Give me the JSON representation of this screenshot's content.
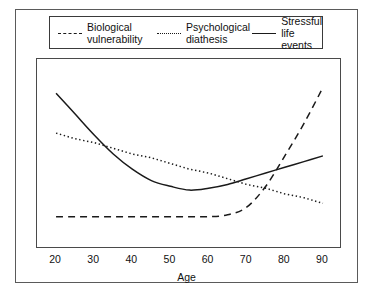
{
  "legend": {
    "position": "top",
    "entries": [
      {
        "name": "biological-vulnerability",
        "label": "Biological\nvulnerability",
        "style": "dashed",
        "color": "#1a1a1a"
      },
      {
        "name": "psychological-diathesis",
        "label": "Psychological\ndiathesis",
        "style": "dotted",
        "color": "#1a1a1a"
      },
      {
        "name": "stressful-life-events",
        "label": "Stressful\nlife events",
        "style": "solid",
        "color": "#1a1a1a"
      }
    ]
  },
  "axis": {
    "x_title": "Age",
    "x_ticks": [
      "20",
      "30",
      "40",
      "50",
      "60",
      "70",
      "80",
      "90"
    ]
  },
  "chart_data": {
    "type": "line",
    "title": "",
    "subtitle": "",
    "xlabel": "Age",
    "ylabel": "",
    "xlim": [
      15,
      95
    ],
    "ylim": [
      0,
      100
    ],
    "grid": false,
    "y_axis_ticks_shown": false,
    "legend_position": "top",
    "x": [
      20,
      25,
      30,
      35,
      40,
      45,
      50,
      55,
      60,
      65,
      70,
      75,
      80,
      85,
      90
    ],
    "series": [
      {
        "name": "Biological vulnerability",
        "style": "dashed",
        "color": "#1a1a1a",
        "description": "Flat and low through middle age, then rises steeply after about age 70",
        "values": [
          17,
          17,
          17,
          17,
          17,
          17,
          17,
          17,
          17,
          18,
          22,
          33,
          49,
          66,
          85
        ]
      },
      {
        "name": "Psychological diathesis",
        "style": "dotted",
        "color": "#1a1a1a",
        "description": "Straight gentle linear decline across the whole age range",
        "values": [
          61,
          58,
          56,
          53,
          50,
          48,
          45,
          42,
          40,
          37,
          34,
          32,
          29,
          27,
          24
        ]
      },
      {
        "name": "Stressful life events",
        "style": "solid",
        "color": "#1a1a1a",
        "description": "U-shaped: high in early adulthood, trough near age 55, rising again after 60",
        "values": [
          82,
          71,
          60,
          50,
          42,
          36,
          33,
          31,
          32,
          34,
          37,
          40,
          43,
          46,
          49
        ]
      }
    ],
    "annotations": [
      {
        "text": "solid and dotted curves cross near age 30"
      },
      {
        "text": "dashed curve crosses dotted curve near age 78"
      },
      {
        "text": "dashed curve crosses solid curve near age 83"
      }
    ]
  }
}
